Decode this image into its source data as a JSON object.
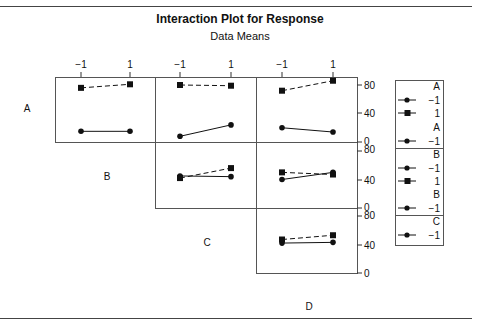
{
  "chart_data": {
    "type": "line",
    "title": "Interaction Plot for Response",
    "subtitle": "Data Means",
    "factors": [
      "A",
      "B",
      "C",
      "D"
    ],
    "levels": [
      "-1",
      "1"
    ],
    "x_tick_labels": [
      "−1",
      "1",
      "−1",
      "1",
      "−1",
      "1"
    ],
    "y_tick_labels": [
      "0",
      "40",
      "80"
    ],
    "ylim": [
      0,
      80
    ],
    "grid": false,
    "legend_position": "right",
    "panels": [
      {
        "row": "A",
        "col": "B",
        "series": [
          {
            "name": "A = -1",
            "marker": "circle",
            "linestyle": "solid",
            "x": [
              "-1",
              "1"
            ],
            "values": [
              15,
              15
            ]
          },
          {
            "name": "A = 1",
            "marker": "square",
            "linestyle": "dashed",
            "x": [
              "-1",
              "1"
            ],
            "values": [
              76,
              81
            ]
          }
        ]
      },
      {
        "row": "A",
        "col": "C",
        "series": [
          {
            "name": "A = -1",
            "marker": "circle",
            "linestyle": "solid",
            "x": [
              "-1",
              "1"
            ],
            "values": [
              8,
              24
            ]
          },
          {
            "name": "A = 1",
            "marker": "square",
            "linestyle": "dashed",
            "x": [
              "-1",
              "1"
            ],
            "values": [
              80,
              79
            ]
          }
        ]
      },
      {
        "row": "A",
        "col": "D",
        "series": [
          {
            "name": "A = -1",
            "marker": "circle",
            "linestyle": "solid",
            "x": [
              "-1",
              "1"
            ],
            "values": [
              20,
              14
            ]
          },
          {
            "name": "A = 1",
            "marker": "square",
            "linestyle": "dashed",
            "x": [
              "-1",
              "1"
            ],
            "values": [
              72,
              86
            ]
          }
        ]
      },
      {
        "row": "B",
        "col": "C",
        "series": [
          {
            "name": "B = -1",
            "marker": "circle",
            "linestyle": "solid",
            "x": [
              "-1",
              "1"
            ],
            "values": [
              45,
              44
            ]
          },
          {
            "name": "B = 1",
            "marker": "square",
            "linestyle": "dashed",
            "x": [
              "-1",
              "1"
            ],
            "values": [
              42,
              56
            ]
          }
        ]
      },
      {
        "row": "B",
        "col": "D",
        "series": [
          {
            "name": "B = -1",
            "marker": "circle",
            "linestyle": "solid",
            "x": [
              "-1",
              "1"
            ],
            "values": [
              40,
              50
            ]
          },
          {
            "name": "B = 1",
            "marker": "square",
            "linestyle": "dashed",
            "x": [
              "-1",
              "1"
            ],
            "values": [
              50,
              47
            ]
          }
        ]
      },
      {
        "row": "C",
        "col": "D",
        "series": [
          {
            "name": "C = -1",
            "marker": "circle",
            "linestyle": "solid",
            "x": [
              "-1",
              "1"
            ],
            "values": [
              42,
              43
            ]
          },
          {
            "name": "C = 1",
            "marker": "square",
            "linestyle": "dashed",
            "x": [
              "-1",
              "1"
            ],
            "values": [
              47,
              53
            ]
          }
        ]
      }
    ],
    "legend": [
      {
        "factor": "A",
        "entries": [
          {
            "marker": "circle",
            "label": "−1"
          },
          {
            "marker": "square",
            "label": "1"
          }
        ]
      },
      {
        "factor": "A",
        "entries": [
          {
            "marker": "circle",
            "label": "−1"
          }
        ]
      },
      {
        "factor": "B",
        "entries": [
          {
            "marker": "circle",
            "label": "−1"
          },
          {
            "marker": "square",
            "label": "1"
          }
        ]
      },
      {
        "factor": "B",
        "entries": [
          {
            "marker": "circle",
            "label": "−1"
          }
        ]
      },
      {
        "factor": "C",
        "entries": [
          {
            "marker": "circle",
            "label": "−1"
          },
          {
            "marker": "square",
            "label": "1"
          }
        ]
      }
    ]
  },
  "labels": {
    "title": "Interaction Plot for Response",
    "subtitle": "Data Means",
    "row_A": "A",
    "row_B": "B",
    "row_C": "C",
    "col_D": "D",
    "xt_neg": "−1",
    "xt_pos": "1",
    "yt_0": "0",
    "yt_40": "40",
    "yt_80": "80",
    "leg_A": "A",
    "leg_B": "B",
    "leg_C": "C",
    "leg_neg": "−1",
    "leg_pos": "1"
  },
  "colors": {
    "ink": "#111111",
    "frame": "#555555"
  }
}
